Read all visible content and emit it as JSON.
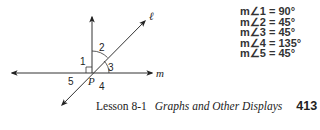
{
  "diagram": {
    "point_label": "P",
    "line_labels": {
      "l": "ℓ",
      "m": "m"
    },
    "angle_labels": [
      "1",
      "2",
      "3",
      "4",
      "5"
    ]
  },
  "measures": [
    {
      "text": "m∠1 = 90°"
    },
    {
      "text": "m∠2 = 45°"
    },
    {
      "text": "m∠3 = 45°"
    },
    {
      "text": "m∠4 = 135°"
    },
    {
      "text": "m∠5 = 45°"
    }
  ],
  "footer": {
    "lesson": "Lesson 8-1",
    "title": "Graphs and Other Displays",
    "page_number": "413"
  }
}
